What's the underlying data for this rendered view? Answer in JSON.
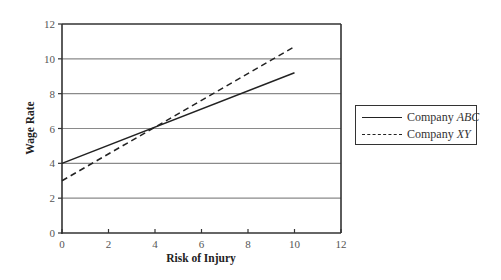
{
  "chart_data": {
    "type": "line",
    "title": "",
    "xlabel": "Risk of Injury",
    "ylabel": "Wage Rate",
    "xlim": [
      0,
      12
    ],
    "ylim": [
      0,
      12
    ],
    "x_ticks": [
      0,
      2,
      4,
      6,
      8,
      10,
      12
    ],
    "y_ticks": [
      0,
      2,
      4,
      6,
      8,
      10,
      12
    ],
    "grid": "horizontal",
    "legend_position": "right",
    "series": [
      {
        "name": "Company ABC",
        "name_prefix": "Company ",
        "name_italic": "ABC",
        "style": "solid",
        "x": [
          0,
          10
        ],
        "y": [
          4,
          9.2
        ]
      },
      {
        "name": "Company XY",
        "name_prefix": "Company ",
        "name_italic": "XY",
        "style": "dashed",
        "x": [
          0,
          10
        ],
        "y": [
          3,
          10.7
        ]
      }
    ],
    "annotations": []
  }
}
